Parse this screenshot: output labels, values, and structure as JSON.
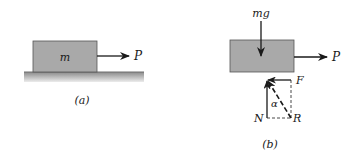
{
  "panels": {
    "a": {
      "caption": "(a)",
      "mass_label": "m",
      "force_label": "P"
    },
    "b": {
      "caption": "(b)",
      "weight_label": "mg",
      "force_label": "P",
      "normal_label": "N",
      "friction_label": "F",
      "resultant_label": "R",
      "angle_label": "α"
    }
  },
  "colors": {
    "block": "#a9a9a9",
    "ground_top": "#8a8a8a",
    "ground_bottom": "#e6e6e6",
    "line": "#1a1a1a"
  }
}
